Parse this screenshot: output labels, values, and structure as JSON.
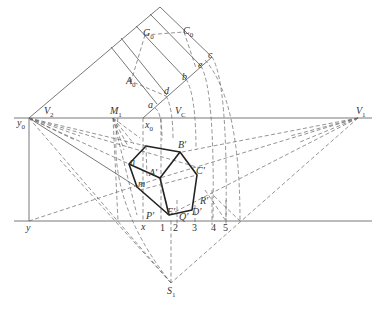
{
  "diagram": {
    "type": "perspective-construction",
    "labels": {
      "G0": {
        "main": "G",
        "sub": "0"
      },
      "C0": {
        "main": "C",
        "sub": "0"
      },
      "A0": {
        "main": "A",
        "sub": "0"
      },
      "a": "a",
      "b": "b",
      "c": "c",
      "d": "d",
      "e": "e",
      "V2": {
        "main": "V",
        "sub": "2"
      },
      "V1": {
        "main": "V",
        "sub": "1"
      },
      "VC": {
        "main": "V",
        "sub": "C"
      },
      "M1": {
        "main": "M",
        "sub": "1"
      },
      "x0": {
        "main": "x",
        "sub": "0"
      },
      "y0": {
        "main": "y",
        "sub": "0"
      },
      "x": "x",
      "y": "y",
      "S1": {
        "main": "S",
        "sub": "1"
      },
      "Bp": "B′",
      "Cp": "C′",
      "Ap": "A′",
      "Rp": "R′",
      "Dp": "D′",
      "Ep": "E′",
      "Qp": "Q′",
      "Pp": "P′",
      "n": "n",
      "m": "m",
      "ticks": [
        "1",
        "2",
        "3",
        "4",
        "5"
      ]
    }
  }
}
